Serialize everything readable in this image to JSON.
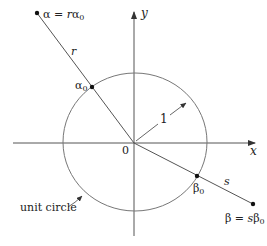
{
  "figure": {
    "axes": {
      "x_label": "x",
      "y_label": "y",
      "origin_label": "0"
    },
    "unit_circle": {
      "label": "unit circle",
      "radius_label": "1"
    },
    "points": {
      "alpha": {
        "label_lhs": "α",
        "label_eq": " = ",
        "label_rhs_coef": "r",
        "label_rhs_base": "α",
        "label_rhs_sub": "0"
      },
      "alpha0": {
        "label_base": "α",
        "label_sub": "0"
      },
      "beta": {
        "label_lhs": "β",
        "label_eq": " = ",
        "label_rhs_coef": "s",
        "label_rhs_base": "β",
        "label_rhs_sub": "0"
      },
      "beta0": {
        "label_base": "β",
        "label_sub": "0"
      }
    },
    "segments": {
      "r_label": "r",
      "s_label": "s"
    },
    "colors": {
      "stroke": "#555555",
      "text": "#222222"
    }
  }
}
